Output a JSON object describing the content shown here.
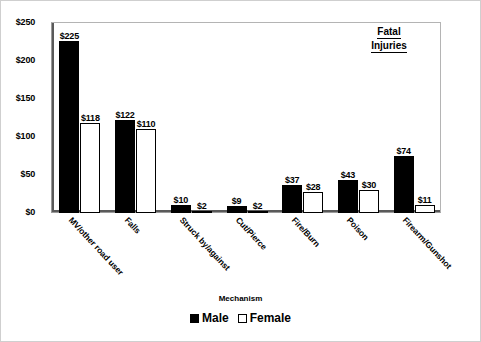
{
  "chart_data": {
    "type": "bar",
    "title": "Fatal Injuries",
    "title_lines": [
      "Fatal",
      "Injuries"
    ],
    "xlabel": "Mechanism",
    "ylabel": "",
    "ylim": [
      0,
      250
    ],
    "ytick_labels": [
      "$250",
      "$200",
      "$150",
      "$100",
      "$50",
      "$0"
    ],
    "ytick_values": [
      250,
      200,
      150,
      100,
      50,
      0
    ],
    "grid": false,
    "legend_position": "bottom",
    "categories": [
      "MV/other road user",
      "Falls",
      "Struck by/against",
      "Cut/Pierce",
      "Fire/Burn",
      "Poison",
      "Firearm/Gunshot"
    ],
    "series": [
      {
        "name": "Male",
        "fill": "solid-black",
        "values": [
          225,
          122,
          10,
          9,
          37,
          43,
          74
        ],
        "labels": [
          "$225",
          "$122",
          "$10",
          "$9",
          "$37",
          "$43",
          "$74"
        ]
      },
      {
        "name": "Female",
        "fill": "dotted-white",
        "values": [
          118,
          110,
          2,
          2,
          28,
          30,
          11
        ],
        "labels": [
          "$118",
          "$110",
          "$2",
          "$2",
          "$28",
          "$30",
          "$11"
        ]
      }
    ]
  },
  "colors": {
    "male": "#000000",
    "female": "#ffffff",
    "axis": "#5a5a5a",
    "frame": "#b4b4b4",
    "background": "#ffffff"
  }
}
